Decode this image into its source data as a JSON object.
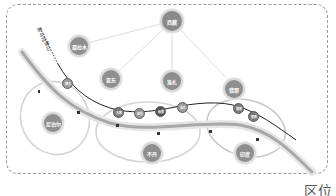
{
  "diagram": {
    "title": "区位",
    "range_label": "喜马拉雅山",
    "top_node": {
      "label": "西藏"
    },
    "ring_nodes": [
      {
        "label": "聂拉木"
      },
      {
        "label": "亚东"
      },
      {
        "label": "洛扎"
      },
      {
        "label": "错那"
      }
    ],
    "route_nodes": [
      {
        "label": "樟木"
      },
      {
        "label": "吉隆"
      },
      {
        "label": "亚东"
      },
      {
        "label": "帕里"
      },
      {
        "label": "洛扎"
      },
      {
        "label": "错那"
      },
      {
        "label": "墨脱"
      }
    ],
    "countries": [
      {
        "label": "尼泊尔"
      },
      {
        "label": "不丹"
      },
      {
        "label": "印度"
      }
    ],
    "colors": {
      "frame": "#9a9a9a",
      "node": "#8a8a8a",
      "node_dark": "#505050",
      "route_line": "#222222",
      "range_band": "#b5b5b5",
      "region_ellipse": "#cfcfcf"
    }
  }
}
